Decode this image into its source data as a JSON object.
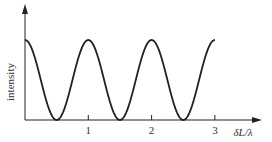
{
  "chart_data": {
    "type": "line",
    "title": "",
    "xlabel": "δL/λ",
    "ylabel": "intensity",
    "x_ticks": [
      "1",
      "2",
      "3"
    ],
    "xlim": [
      0,
      3.2
    ],
    "ylim": [
      0,
      1.2
    ],
    "grid": false,
    "series": [
      {
        "name": "intensity",
        "function": "cos^2(pi*x)",
        "x": [
          0,
          0.25,
          0.5,
          0.75,
          1,
          1.25,
          1.5,
          1.75,
          2,
          2.25,
          2.5,
          2.75,
          3
        ],
        "values": [
          1,
          0.5,
          0,
          0.5,
          1,
          0.5,
          0,
          0.5,
          1,
          0.5,
          0,
          0.5,
          1
        ]
      }
    ]
  }
}
